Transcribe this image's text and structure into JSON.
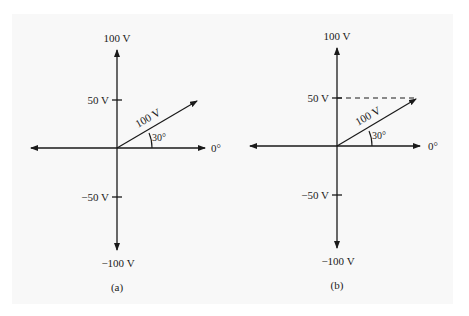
{
  "figure": {
    "panels": [
      {
        "id": "a",
        "caption": "(a)",
        "y_labels": {
          "top": "100 V",
          "pos50": "50 V",
          "neg50": "−50 V",
          "bottom": "−100 V"
        },
        "x_label": "0°",
        "vector_label": "100 V",
        "angle_label": "30°",
        "projection_line": false
      },
      {
        "id": "b",
        "caption": "(b)",
        "y_labels": {
          "top": "100 V",
          "pos50": "50 V",
          "neg50": "−50 V",
          "bottom": "−100 V"
        },
        "x_label": "0°",
        "vector_label": "100 V",
        "angle_label": "30°",
        "projection_line": true
      }
    ],
    "colors": {
      "ink": "#1a1a1a",
      "background": "#f8f8f8",
      "page": "#ffffff"
    }
  }
}
